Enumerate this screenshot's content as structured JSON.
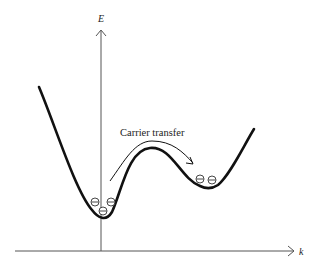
{
  "diagram": {
    "title": "",
    "axes": {
      "y_label": "E",
      "x_label": "k"
    },
    "annotation": {
      "label": "Carrier transfer"
    },
    "electron_symbol": "⊖",
    "valleys": [
      {
        "name": "central-valley",
        "electron_count": 3
      },
      {
        "name": "satellite-valley",
        "electron_count": 2
      }
    ],
    "colors": {
      "line": "#111111",
      "axis": "#444444",
      "text": "#222222",
      "background": "#ffffff"
    }
  }
}
